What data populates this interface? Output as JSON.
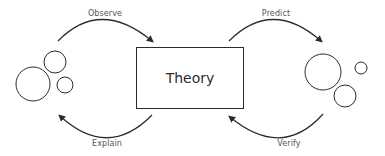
{
  "diagram": {
    "center": {
      "label": "Theory"
    },
    "arrows": {
      "observe": {
        "label": "Observe"
      },
      "predict": {
        "label": "Predict"
      },
      "explain": {
        "label": "Explain"
      },
      "verify": {
        "label": "Verify"
      }
    },
    "groups": {
      "left": {
        "name": "observations",
        "circles": 3
      },
      "right": {
        "name": "predictions",
        "circles": 3
      }
    },
    "colors": {
      "stroke": "#2b2b2b",
      "label": "#555555",
      "background": "#ffffff"
    }
  }
}
